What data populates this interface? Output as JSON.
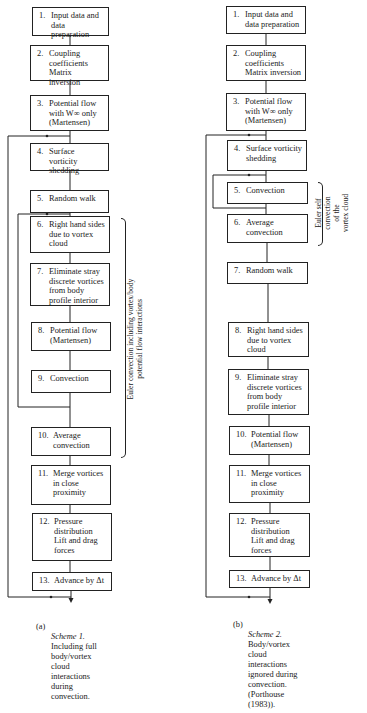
{
  "figure": {
    "scheme_a": {
      "steps": [
        {
          "num": "1.",
          "text": "Input data and\ndata preparation"
        },
        {
          "num": "2.",
          "text": "Coupling\ncoefficients\nMatrix inversion"
        },
        {
          "num": "3.",
          "text": "Potential flow\nwith W∞ only\n(Martensen)"
        },
        {
          "num": "4.",
          "text": "Surface vorticity\nshedding"
        },
        {
          "num": "5.",
          "text": "Random walk"
        },
        {
          "num": "6.",
          "text": "Right hand sides\ndue to vortex\ncloud"
        },
        {
          "num": "7.",
          "text": "Eliminate stray\ndiscrete vortices\nfrom body\nprofile interior"
        },
        {
          "num": "8.",
          "text": "Potential flow\n(Martensen)"
        },
        {
          "num": "9.",
          "text": "Convection"
        },
        {
          "num": "10.",
          "text": "Average\nconvection"
        },
        {
          "num": "11.",
          "text": "Merge vortices\nin close\nproximity"
        },
        {
          "num": "12.",
          "text": "Pressure\ndistribution\nLift and drag\nforces"
        },
        {
          "num": "13.",
          "text": "Advance by Δt"
        }
      ],
      "bracket_label": "Euler convection including vortex/body\npotential flow interactions",
      "caption_tag": "(a)",
      "caption_title": "Scheme 1.",
      "caption_body": "Including full\nbody/vortex\ncloud\ninteractions\nduring\nconvection."
    },
    "scheme_b": {
      "steps": [
        {
          "num": "1.",
          "text": "Input data and\ndata preparation"
        },
        {
          "num": "2.",
          "text": "Coupling\ncoefficients\nMatrix inversion"
        },
        {
          "num": "3.",
          "text": "Potential flow\nwith W∞ only\n(Martensen)"
        },
        {
          "num": "4.",
          "text": "Surface vorticity\nshedding"
        },
        {
          "num": "5.",
          "text": "Convection"
        },
        {
          "num": "6.",
          "text": "Average\nconvection"
        },
        {
          "num": "7.",
          "text": "Random walk"
        },
        {
          "num": "8.",
          "text": "Right hand sides\ndue to vortex\ncloud"
        },
        {
          "num": "9.",
          "text": "Eliminate stray\ndiscrete vortices\nfrom body\nprofile interior"
        },
        {
          "num": "10.",
          "text": "Potential flow\n(Martensen)"
        },
        {
          "num": "11.",
          "text": "Merge vortices\nin close\nproximity"
        },
        {
          "num": "12.",
          "text": "Pressure\ndistribution\nLift and drag\nforces"
        },
        {
          "num": "13.",
          "text": "Advance by Δt"
        }
      ],
      "bracket_label": "Euler self\nconvection\nof the\nvortex cloud",
      "caption_tag": "(b)",
      "caption_title": "Scheme 2.",
      "caption_body": "Body/vortex\ncloud\ninteractions\nignored during\nconvection.\n(Porthouse\n(1983))."
    }
  }
}
